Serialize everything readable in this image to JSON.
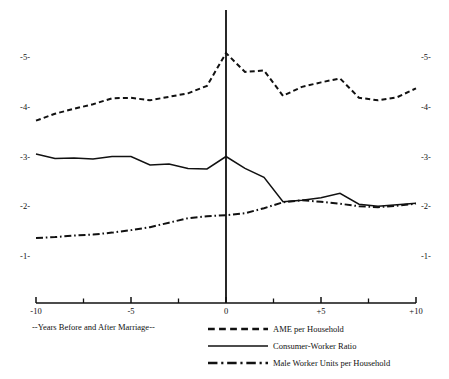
{
  "chart_data": {
    "type": "line",
    "title": "",
    "subtitle": "",
    "xlabel": "--Years Before and After Marriage--",
    "ylabel": "",
    "xlim": [
      -10,
      10
    ],
    "ylim": [
      0.55,
      5.45
    ],
    "grid": false,
    "legend_position": "bottom-right",
    "x_tick_labels": [
      "-10",
      "-5",
      "0",
      "+5",
      "+10"
    ],
    "x_tick_values": [
      -10,
      -5,
      0,
      5,
      10
    ],
    "x_minor_tick_values": [
      -7.5,
      -2.5,
      2.5,
      7.5
    ],
    "y_tick_labels_left": [
      "-5-",
      "-4-",
      "-3-",
      "-2-",
      "-1-"
    ],
    "y_tick_labels_right": [
      "-5-",
      "-4-",
      "-3-",
      "-2-",
      "-1-"
    ],
    "y_tick_values": [
      5,
      4,
      3,
      2,
      1
    ],
    "marriage_marker_x": 0,
    "x": [
      -10,
      -9,
      -8,
      -7,
      -6,
      -5,
      -4,
      -3,
      -2,
      -1,
      0,
      1,
      2,
      3,
      4,
      5,
      6,
      7,
      8,
      9,
      10
    ],
    "series": [
      {
        "name": "AME per Household",
        "style": "dashed",
        "values": [
          3.72,
          3.86,
          3.96,
          4.05,
          4.17,
          4.18,
          4.13,
          4.2,
          4.27,
          4.42,
          5.08,
          4.7,
          4.73,
          4.22,
          4.4,
          4.49,
          4.57,
          4.18,
          4.13,
          4.19,
          4.37
        ]
      },
      {
        "name": "Consumer-Worker Ratio",
        "style": "solid",
        "values": [
          3.05,
          2.96,
          2.97,
          2.95,
          3.0,
          3.0,
          2.83,
          2.85,
          2.76,
          2.75,
          3.0,
          2.76,
          2.58,
          2.09,
          2.12,
          2.17,
          2.26,
          2.04,
          2.0,
          2.03,
          2.06
        ]
      },
      {
        "name": "Male Worker Units per Household",
        "style": "dash-dot",
        "values": [
          1.36,
          1.38,
          1.41,
          1.43,
          1.47,
          1.52,
          1.58,
          1.67,
          1.76,
          1.8,
          1.82,
          1.86,
          1.96,
          2.08,
          2.12,
          2.09,
          2.05,
          2.0,
          1.98,
          2.01,
          2.05
        ]
      }
    ]
  },
  "legend": {
    "items": [
      {
        "label": "AME per Household",
        "style": "dashed"
      },
      {
        "label": "Consumer-Worker Ratio",
        "style": "solid"
      },
      {
        "label": "Male Worker Units per Household",
        "style": "dash-dot"
      }
    ]
  },
  "axis": {
    "x_caption": "--Years Before and After Marriage--"
  }
}
